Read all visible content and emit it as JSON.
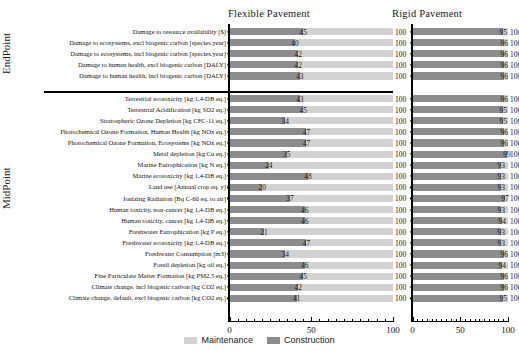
{
  "headers": {
    "flexible": "Flexible Pavement",
    "rigid": "Rigid Pavement"
  },
  "groups": {
    "endpoint": "EndPoint",
    "midpoint": "MidPoint"
  },
  "legend": {
    "maintenance": "Maintenance",
    "construction": "Construction",
    "maintenance_color": "#d2d2d2",
    "construction_color": "#8c8c8c"
  },
  "axis": {
    "ticks": [
      "0",
      "50",
      "100"
    ],
    "tick_values": [
      0,
      50,
      100
    ],
    "min": 0,
    "max": 100
  },
  "chart_data": {
    "type": "bar",
    "orientation": "horizontal",
    "stacked": true,
    "percent": true,
    "title": "",
    "xlabel": "",
    "ylabel": "",
    "xlim": [
      0,
      100
    ],
    "grid": false,
    "legend_position": "bottom-center",
    "panels": [
      "Flexible Pavement",
      "Rigid Pavement"
    ],
    "series": [
      {
        "name": "Construction",
        "color": "#8c8c8c"
      },
      {
        "name": "Maintenance",
        "color": "#d2d2d2"
      }
    ],
    "groups": [
      {
        "name": "EndPoint",
        "categories": [
          "Damage to resource availability [$]",
          "Damage to ecosystems, excl biogenic carbon [species.year]",
          "Damage to ecosystems, incl biogenic carbon [species.year]",
          "Damage to human health, excl biogenic carbon [DALY]",
          "Damage to human health, incl biogenic carbon [DALY]"
        ],
        "flexible_construction": [
          45,
          40,
          42,
          42,
          43
        ],
        "flexible_total": [
          100,
          100,
          100,
          100,
          100
        ],
        "rigid_construction": [
          95,
          96,
          96,
          96,
          96
        ],
        "rigid_total": [
          100,
          100,
          100,
          100,
          100
        ]
      },
      {
        "name": "MidPoint",
        "categories": [
          "Terrestrial ecotoxicity [kg 1,4-DB eq.]",
          "Terrestrial Acidification [kg SO2 eq.]",
          "Stratospheric Ozone Depletion [kg CFC-11 eq.]",
          "Photochemical Ozone Formation, Human Health [kg NOx eq.]",
          "Photochemical Ozone Formation, Ecosystems [kg NOx eq.]",
          "Metal depletion [kg Cu eq.]",
          "Marine Eutrophication [kg N eq.]",
          "Marine ecotoxicity [kg 1,4-DB eq.]",
          "Land use [Annual crop eq. y]",
          "Ionizing Radiation [Bq C-60 eq. to air]",
          "Human toxicity, non-cancer [kg 1,4-DB eq.]",
          "Human toxicity, cancer [kg 1,4-DB eq.]",
          "Freshwater Eutrophication [kg P eq.]",
          "Freshwater ecotoxicity [kg 1,4-DB eq.]",
          "Freshwater Consumption [m3]",
          "Fossil depletion [kg oil eq.]",
          "Fine Particulate Matter Formation [kg PM2.5 eq.]",
          "Climate change, incl biogenic carbon [kg CO2 eq.]",
          "Climate change, default, excl biogenic carbon [kg CO2 eq.]"
        ],
        "flexible_construction": [
          43,
          45,
          34,
          47,
          47,
          35,
          24,
          48,
          20,
          37,
          46,
          46,
          21,
          47,
          34,
          46,
          45,
          42,
          41
        ],
        "flexible_total": [
          100,
          100,
          100,
          100,
          100,
          100,
          100,
          100,
          100,
          100,
          100,
          100,
          100,
          100,
          100,
          100,
          100,
          100,
          100
        ],
        "rigid_construction": [
          96,
          95,
          95,
          96,
          96,
          99,
          93,
          93,
          93,
          97,
          93,
          94,
          93,
          93,
          96,
          94,
          96,
          96,
          95
        ],
        "rigid_total": [
          100,
          100,
          100,
          100,
          100,
          100,
          100,
          100,
          100,
          100,
          100,
          100,
          100,
          100,
          100,
          100,
          100,
          100,
          100
        ]
      }
    ]
  }
}
